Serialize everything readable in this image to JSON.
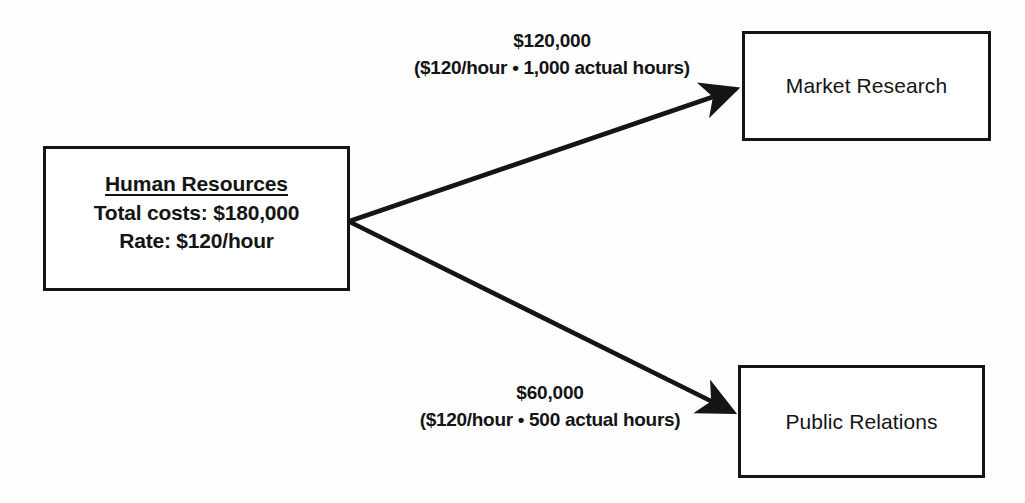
{
  "diagram": {
    "source": {
      "name": "Human Resources",
      "total_costs": "Total costs: $180,000",
      "rate": "Rate: $120/hour"
    },
    "edges": [
      {
        "id": "market",
        "amount": "$120,000",
        "detail": "($120/hour • 1,000 actual hours)",
        "target": "Market Research"
      },
      {
        "id": "public",
        "amount": "$60,000",
        "detail": "($120/hour • 500 actual hours)",
        "target": "Public Relations"
      }
    ],
    "targets": [
      {
        "label": "Market Research"
      },
      {
        "label": "Public Relations"
      }
    ],
    "colors": {
      "stroke": "#151515",
      "text": "#141414",
      "background": "#fefefe"
    }
  }
}
